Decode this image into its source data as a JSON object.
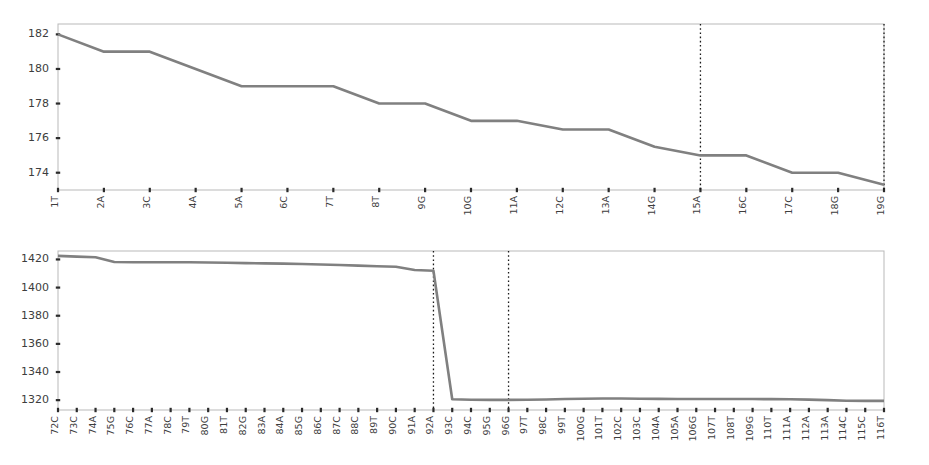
{
  "figure": {
    "background": "#ffffff",
    "line_color": "#808080",
    "marker_line_color": "#1a1a1a",
    "axis_color": "#b9b9b9",
    "tick_color": "#2b2b2b",
    "label_color": "#3d3d3d"
  },
  "chart_data": [
    {
      "type": "line",
      "id": "top",
      "title": "",
      "subtitle": "",
      "xlabel": "",
      "ylabel": "",
      "grid": false,
      "legend": "none",
      "xlim": [
        0,
        18
      ],
      "ylim": [
        173.0,
        182.6
      ],
      "ytick_values": [
        174,
        176,
        178,
        180,
        182
      ],
      "ytick_labels": [
        "174",
        "176",
        "178",
        "180",
        "182"
      ],
      "categories": [
        "1T",
        "2A",
        "3C",
        "4A",
        "5A",
        "6C",
        "7T",
        "8T",
        "9G",
        "10G",
        "11A",
        "12C",
        "13A",
        "14G",
        "15A",
        "16C",
        "17C",
        "18G",
        "19G"
      ],
      "values": [
        182.0,
        181.0,
        181.0,
        180.0,
        179.0,
        179.0,
        179.0,
        178.0,
        178.0,
        177.0,
        177.0,
        176.5,
        176.5,
        175.5,
        175.0,
        175.0,
        174.0,
        174.0,
        173.3
      ],
      "annotations": [
        {
          "type": "vline",
          "category": "15A",
          "style": "dotted"
        },
        {
          "type": "vline",
          "category": "19G",
          "style": "dotted"
        }
      ]
    },
    {
      "type": "line",
      "id": "bottom",
      "title": "",
      "subtitle": "",
      "xlabel": "",
      "ylabel": "",
      "grid": false,
      "legend": "none",
      "xlim": [
        0,
        44
      ],
      "ylim": [
        1313.0,
        1426.0
      ],
      "ytick_values": [
        1320,
        1340,
        1360,
        1380,
        1400,
        1420
      ],
      "ytick_labels": [
        "1320",
        "1340",
        "1360",
        "1380",
        "1400",
        "1420"
      ],
      "categories": [
        "72C",
        "73C",
        "74A",
        "75G",
        "76C",
        "77A",
        "78C",
        "79T",
        "80G",
        "81T",
        "82G",
        "83A",
        "84A",
        "85G",
        "86C",
        "87C",
        "88C",
        "89T",
        "90C",
        "91A",
        "92A",
        "93C",
        "94C",
        "95G",
        "96G",
        "97T",
        "98C",
        "99T",
        "100G",
        "101T",
        "102C",
        "103C",
        "104A",
        "105A",
        "106G",
        "107T",
        "108T",
        "109G",
        "110T",
        "111A",
        "112A",
        "113A",
        "114C",
        "115C",
        "116T"
      ],
      "values": [
        1422.5,
        1422.0,
        1421.6,
        1418.2,
        1418.0,
        1418.0,
        1418.0,
        1418.0,
        1417.8,
        1417.6,
        1417.4,
        1417.2,
        1417.0,
        1416.8,
        1416.4,
        1416.0,
        1415.6,
        1415.2,
        1414.8,
        1412.5,
        1412.0,
        1320.6,
        1320.3,
        1320.2,
        1320.2,
        1320.3,
        1320.5,
        1320.8,
        1321.0,
        1321.2,
        1321.2,
        1321.0,
        1320.9,
        1320.8,
        1320.8,
        1320.8,
        1320.8,
        1320.8,
        1320.7,
        1320.6,
        1320.4,
        1320.0,
        1319.6,
        1319.5,
        1319.5
      ],
      "annotations": [
        {
          "type": "vline",
          "category": "92A",
          "style": "dotted"
        },
        {
          "type": "vline",
          "category": "96G",
          "style": "dotted"
        }
      ]
    }
  ]
}
